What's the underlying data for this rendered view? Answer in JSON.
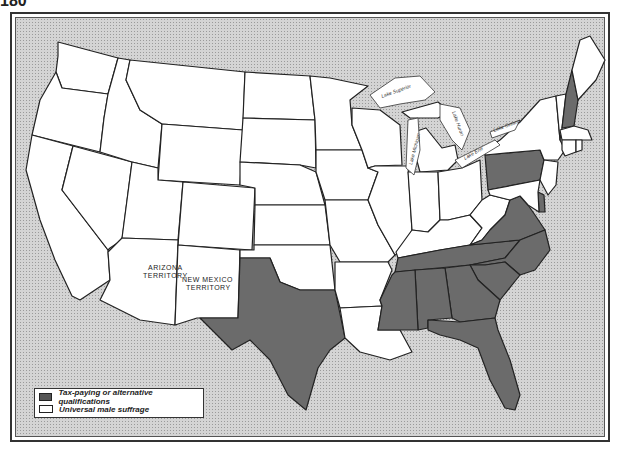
{
  "page": {
    "number": "180"
  },
  "map": {
    "title": "",
    "colors": {
      "tax_paying": "#6b6b6b",
      "universal": "#ffffff",
      "background": "#d4d4d4"
    },
    "labels": {
      "arizona_line1": "ARIZONA",
      "arizona_line2": "TERRITORY",
      "newmexico_line1": "NEW MEXICO",
      "newmexico_line2": "TERRITORY",
      "lake_superior": "Lake Superior",
      "lake_michigan": "Lake Michigan",
      "lake_huron": "Lake Huron",
      "lake_erie": "Lake Erie",
      "lake_ontario": "Lake Ontario"
    },
    "tax_paying_states": [
      "New Hampshire",
      "Pennsylvania",
      "Delaware",
      "Virginia",
      "North Carolina",
      "South Carolina",
      "Georgia",
      "Florida",
      "Alabama",
      "Mississippi",
      "Tennessee",
      "Texas"
    ],
    "universal_states": [
      "Washington",
      "Oregon",
      "California",
      "Nevada",
      "Idaho",
      "Montana",
      "Wyoming",
      "Utah",
      "Colorado",
      "Arizona Territory",
      "New Mexico Territory",
      "North Dakota",
      "South Dakota",
      "Nebraska",
      "Kansas",
      "Oklahoma",
      "Minnesota",
      "Iowa",
      "Missouri",
      "Arkansas",
      "Louisiana",
      "Wisconsin",
      "Illinois",
      "Michigan",
      "Indiana",
      "Ohio",
      "Kentucky",
      "West Virginia",
      "Maryland",
      "New Jersey",
      "New York",
      "Connecticut",
      "Rhode Island",
      "Massachusetts",
      "Vermont",
      "Maine"
    ]
  },
  "legend": {
    "items": [
      {
        "label": "Tax-paying or alternative qualifications",
        "swatch": "dark"
      },
      {
        "label": "Universal male suffrage",
        "swatch": "white"
      }
    ]
  }
}
